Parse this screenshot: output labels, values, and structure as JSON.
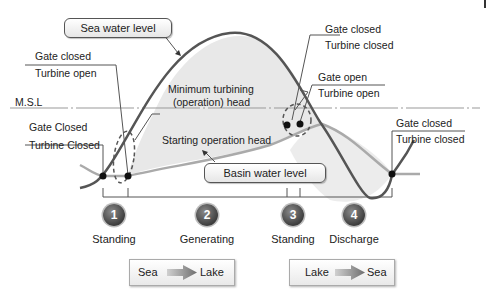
{
  "diagram": {
    "title_callouts": {
      "sea_water_level": "Sea water level",
      "basin_water_level": "Basin water level"
    },
    "reference_line": {
      "label": "M.S.L"
    },
    "annotations": {
      "min_turbining_head_line1": "Minimum turbining",
      "min_turbining_head_line2": "(operation) head",
      "starting_operation_head": "Starting operation head"
    },
    "state_labels": [
      {
        "gate": "Gate closed",
        "turbine": "Turbine open"
      },
      {
        "gate": "Gate Closed",
        "turbine": "Turbine Closed"
      },
      {
        "gate": "Gate closed",
        "turbine": "Turbine closed"
      },
      {
        "gate": "Gate open",
        "turbine": "Turbine open"
      },
      {
        "gate": "Gate closed",
        "turbine": "Turbine closed"
      }
    ],
    "steps": [
      {
        "number": "1",
        "label": "Standing"
      },
      {
        "number": "2",
        "label": "Generating"
      },
      {
        "number": "3",
        "label": "Standing"
      },
      {
        "number": "4",
        "label": "Discharge"
      }
    ],
    "flows": [
      {
        "from": "Sea",
        "to": "Lake"
      },
      {
        "from": "Lake",
        "to": "Sea"
      }
    ],
    "colors": {
      "sea_curve": "#555555",
      "basin_curve": "#aaaaaa",
      "fill": "#e8e8e8",
      "arrow": "#8c8c8c"
    }
  }
}
